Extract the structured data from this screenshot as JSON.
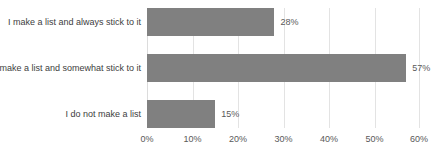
{
  "chart_data": {
    "type": "bar",
    "orientation": "horizontal",
    "title": "",
    "xlabel": "",
    "ylabel": "",
    "categories": [
      "I make a list and always stick to it",
      "I make a list and somewhat stick to it",
      "I do not make a list"
    ],
    "values": [
      28,
      57,
      15
    ],
    "value_labels": [
      "28%",
      "57%",
      "15%"
    ],
    "xlim": [
      0,
      60
    ],
    "xticks": [
      0,
      10,
      20,
      30,
      40,
      50,
      60
    ],
    "xtick_labels": [
      "0%",
      "10%",
      "20%",
      "30%",
      "40%",
      "50%",
      "60%"
    ],
    "grid": true,
    "grid_axis": "x",
    "legend": false,
    "colors": {
      "bar": "#808080",
      "gridline": "#e3e3e3",
      "category_label": "#404040",
      "tick_label": "#595959",
      "value_label": "#595959",
      "background": "#ffffff"
    }
  }
}
